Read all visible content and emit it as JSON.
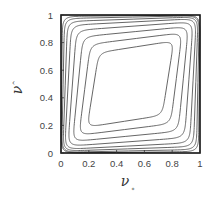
{
  "chart_data": {
    "type": "contour",
    "title": "",
    "xlabel": "ν*",
    "ylabel": "ν^",
    "xlabel_main": "ν",
    "xlabel_sub": "*",
    "ylabel_main": "ν",
    "ylabel_sub": "^",
    "xlim": [
      0,
      1
    ],
    "ylim": [
      0,
      1
    ],
    "x_ticks": [
      "0",
      "0.2",
      "0.4",
      "0.6",
      "0.8",
      "1"
    ],
    "y_ticks": [
      "0",
      "0.2",
      "0.4",
      "0.6",
      "0.8",
      "1"
    ],
    "grid": false,
    "legend": null,
    "line_color": "#555555",
    "frame_color": "#111111",
    "contours": [
      {
        "level": 1,
        "center": [
          0.5,
          0.5
        ],
        "half_width": 0.495,
        "roundness": 0.03
      },
      {
        "level": 2,
        "center": [
          0.5,
          0.5
        ],
        "half_width": 0.485,
        "roundness": 0.06
      },
      {
        "level": 3,
        "center": [
          0.5,
          0.5
        ],
        "half_width": 0.47,
        "roundness": 0.1
      },
      {
        "level": 4,
        "center": [
          0.5,
          0.5
        ],
        "half_width": 0.45,
        "roundness": 0.15
      },
      {
        "level": 5,
        "center": [
          0.5,
          0.5
        ],
        "half_width": 0.42,
        "roundness": 0.21
      },
      {
        "level": 6,
        "center": [
          0.5,
          0.5
        ],
        "half_width": 0.38,
        "roundness": 0.28
      },
      {
        "level": 7,
        "center": [
          0.5,
          0.5
        ],
        "half_width": 0.33,
        "roundness": 0.36
      },
      {
        "level": 8,
        "center": [
          0.5,
          0.5
        ],
        "half_width": 0.27,
        "roundness": 0.45
      }
    ]
  }
}
